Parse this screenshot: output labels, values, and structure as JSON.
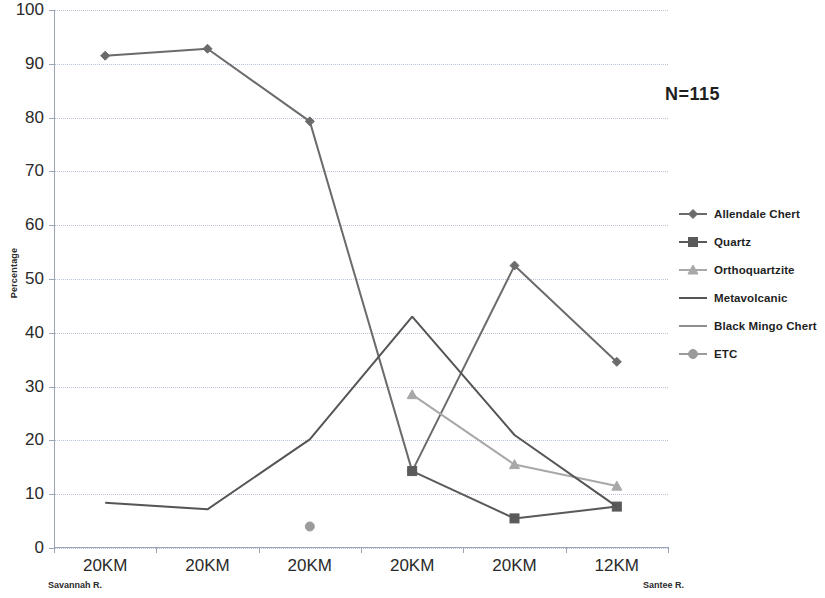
{
  "chart_data": {
    "type": "line",
    "title": "",
    "xlabel": "",
    "ylabel": "Percentage",
    "ylim": [
      0,
      100
    ],
    "ytick_step": 10,
    "yticks": [
      0,
      10,
      20,
      30,
      40,
      50,
      60,
      70,
      80,
      90,
      100
    ],
    "grid": true,
    "legend_position": "right",
    "categories": [
      "20KM",
      "20KM",
      "20KM",
      "20KM",
      "20KM",
      "12KM"
    ],
    "category_endpoints": {
      "left": "Savannah R.",
      "right": "Santee R."
    },
    "annotations": [
      {
        "text": "N=115",
        "x": 0.88,
        "y": 0.86
      }
    ],
    "series": [
      {
        "name": "Allendale Chert",
        "marker": "diamond",
        "color": "#6b6b6b",
        "values": [
          91.5,
          92.8,
          79.3,
          14.3,
          52.5,
          34.6
        ]
      },
      {
        "name": "Quartz",
        "marker": "square",
        "color": "#5a5a5a",
        "values": [
          null,
          null,
          null,
          14.3,
          5.5,
          7.7
        ]
      },
      {
        "name": "Orthoquartzite",
        "marker": "triangle",
        "color": "#a8a8a8",
        "values": [
          null,
          null,
          null,
          28.5,
          15.5,
          11.5
        ]
      },
      {
        "name": "Metavolcanic",
        "marker": "none",
        "color": "#555555",
        "values": [
          8.4,
          7.2,
          20.2,
          43.0,
          21.0,
          7.7
        ]
      },
      {
        "name": "Black Mingo Chert",
        "marker": "none",
        "color": "#8f8f8f",
        "values": [
          null,
          null,
          null,
          null,
          null,
          null
        ]
      },
      {
        "name": "ETC",
        "marker": "circle",
        "color": "#9b9b9b",
        "values": [
          null,
          null,
          4.0,
          null,
          null,
          null
        ]
      }
    ]
  },
  "legend": {
    "items": [
      {
        "label": "Allendale Chert"
      },
      {
        "label": "Quartz"
      },
      {
        "label": "Orthoquartzite"
      },
      {
        "label": "Metavolcanic"
      },
      {
        "label": "Black Mingo Chert"
      },
      {
        "label": "ETC"
      }
    ]
  },
  "axis": {
    "y_title": "Percentage",
    "y_labels": [
      "100",
      "90",
      "80",
      "70",
      "60",
      "50",
      "40",
      "30",
      "20",
      "10",
      "0"
    ],
    "x_labels": [
      "20KM",
      "20KM",
      "20KM",
      "20KM",
      "20KM",
      "12KM"
    ],
    "left_river": "Savannah R.",
    "right_river": "Santee R."
  },
  "annotation": {
    "sample_size": "N=115"
  }
}
